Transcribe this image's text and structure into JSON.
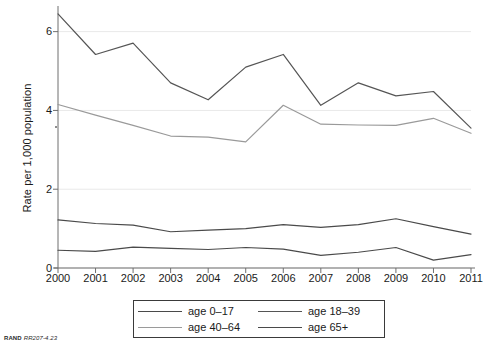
{
  "axes": {
    "y_title": "Rate per 1,000 population",
    "y_ticks": [
      "6",
      "4",
      "2",
      "0"
    ],
    "x_ticks": [
      "2000",
      "2001",
      "2002",
      "2003",
      "2004",
      "2005",
      "2006",
      "2007",
      "2008",
      "2009",
      "2010",
      "2011"
    ]
  },
  "legend": {
    "entries": [
      {
        "label": "age 0–17",
        "color": "#4a4a4a"
      },
      {
        "label": "age 18–39",
        "color": "#555555"
      },
      {
        "label": "age 40–64",
        "color": "#9a9a9a"
      },
      {
        "label": "age 65+",
        "color": "#4a4a4a"
      }
    ]
  },
  "footer": {
    "brand": "RAND",
    "reference": "RR207-4.23"
  },
  "chart_data": {
    "type": "line",
    "title": "",
    "xlabel": "",
    "ylabel": "Rate per 1,000 population",
    "x": [
      2000,
      2001,
      2002,
      2003,
      2004,
      2005,
      2006,
      2007,
      2008,
      2009,
      2010,
      2011
    ],
    "xlim": [
      2000,
      2011
    ],
    "ylim": [
      0,
      6.6
    ],
    "yticks": [
      0,
      2,
      4,
      6
    ],
    "grid": "horizontal",
    "legend_position": "below-center",
    "series": [
      {
        "name": "age 0–17",
        "color": "#4a4a4a",
        "values": [
          1.22,
          1.13,
          1.09,
          0.92,
          0.96,
          1.0,
          1.1,
          1.03,
          1.1,
          1.25,
          1.05,
          0.86
        ]
      },
      {
        "name": "age 18–39",
        "color": "#555555",
        "values": [
          6.45,
          5.42,
          5.71,
          4.7,
          4.27,
          5.1,
          5.42,
          4.13,
          4.7,
          4.37,
          4.48,
          3.55
        ]
      },
      {
        "name": "age 40–64",
        "color": "#9a9a9a",
        "values": [
          4.15,
          3.88,
          3.62,
          3.35,
          3.32,
          3.2,
          4.13,
          3.65,
          3.63,
          3.62,
          3.8,
          3.42
        ]
      },
      {
        "name": "age 65+",
        "color": "#4a4a4a",
        "values": [
          0.45,
          0.42,
          0.53,
          0.5,
          0.47,
          0.52,
          0.48,
          0.32,
          0.4,
          0.52,
          0.2,
          0.34
        ]
      }
    ]
  }
}
